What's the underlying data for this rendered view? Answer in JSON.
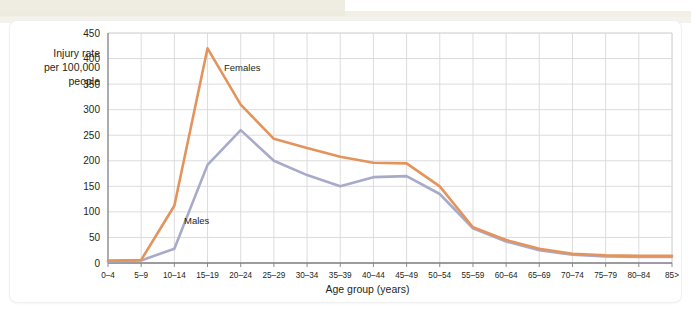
{
  "figure": {
    "y_axis_caption_lines": [
      "Injury rate",
      "per 100,000",
      "people"
    ],
    "x_axis_title": "Age group (years)",
    "series_labels": {
      "females": "Females",
      "males": "Males"
    }
  },
  "chart_data": {
    "type": "line",
    "title": "",
    "xlabel": "Age group (years)",
    "ylabel": "Injury rate per 100,000 people",
    "categories": [
      "0–4",
      "5–9",
      "10–14",
      "15–19",
      "20–24",
      "25–29",
      "30–34",
      "35–39",
      "40–44",
      "45–49",
      "50–54",
      "55–59",
      "60–64",
      "65–69",
      "70–74",
      "75–79",
      "80–84",
      "85>"
    ],
    "series": [
      {
        "name": "Females",
        "color": "#e3945c",
        "values": [
          5,
          6,
          112,
          420,
          310,
          243,
          225,
          208,
          196,
          195,
          150,
          70,
          45,
          28,
          18,
          15,
          14,
          14
        ]
      },
      {
        "name": "Males",
        "color": "#a7aac9",
        "values": [
          3,
          5,
          28,
          192,
          260,
          200,
          172,
          150,
          168,
          170,
          135,
          68,
          42,
          25,
          16,
          13,
          12,
          12
        ]
      }
    ],
    "ylim": [
      0,
      450
    ],
    "yticks": [
      0,
      50,
      100,
      150,
      200,
      250,
      300,
      350,
      400,
      450
    ],
    "grid": true,
    "legend": "inline-annotations"
  },
  "style": {
    "grid_color": "#d8d8da",
    "axis_color": "#808084",
    "plot_bg": "#ffffff",
    "page_bg": "#ffffff"
  }
}
